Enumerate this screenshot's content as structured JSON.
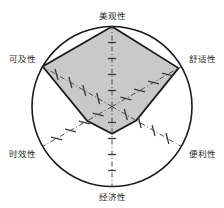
{
  "chart_data": {
    "type": "radar",
    "title": "",
    "categories": [
      "美观性",
      "舒适性",
      "便利性",
      "经济性",
      "时效性",
      "可及性"
    ],
    "values": [
      1.0,
      0.96,
      0.35,
      0.34,
      0.36,
      1.0
    ],
    "rlim": [
      0,
      1
    ],
    "series": [
      {
        "name": "",
        "values": [
          1.0,
          0.96,
          0.35,
          0.34,
          0.36,
          1.0
        ]
      }
    ],
    "xlabel": "",
    "ylabel": "",
    "grid": true,
    "legend": "none",
    "axis_count": 6,
    "axis_angles_deg": [
      90,
      30,
      -30,
      -90,
      -150,
      150
    ],
    "outer_boundary": "circle",
    "tick_marks_per_axis": 5
  },
  "style": {
    "fill_color": "#c9c9c9",
    "stroke_color": "#1a1a1a",
    "circle_color": "#1a1a1a",
    "axis_color": "#555555",
    "label_color": "#2a2a2a",
    "background": "#ffffff"
  },
  "labels": {
    "top": "美观性",
    "upper_right": "舒适性",
    "lower_right": "便利性",
    "bottom": "经济性",
    "lower_left": "时效性",
    "upper_left": "可及性"
  }
}
